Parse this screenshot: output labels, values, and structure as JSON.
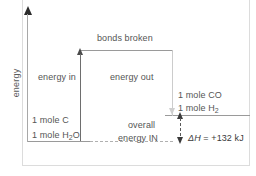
{
  "chart_data": {
    "type": "diagram",
    "ylabel": "energy",
    "xlabel": "",
    "grid": false,
    "legend": "none",
    "levels": [
      {
        "name": "reactants",
        "label_lines": [
          "1 mole C",
          "1 mole H2O"
        ],
        "relative_energy": 0
      },
      {
        "name": "bonds-broken-peak",
        "label": "bonds broken",
        "relative_energy": 1
      },
      {
        "name": "products",
        "label_lines": [
          "1 mole CO",
          "1 mole H2"
        ],
        "relative_energy": 0.29
      }
    ],
    "arrows": [
      {
        "name": "energy-in",
        "label": "energy in",
        "direction": "up"
      },
      {
        "name": "energy-out",
        "label": "energy out",
        "direction": "down"
      },
      {
        "name": "overall-energy-in",
        "label": "overall energy IN",
        "direction": "up",
        "value": "+132 kJ"
      }
    ],
    "enthalpy_change": {
      "symbol": "ΔH",
      "operator": "=",
      "value": "+132",
      "unit": "kJ"
    }
  },
  "diagram": {
    "y_axis_label": "energy",
    "top_level_label": "bonds broken",
    "energy_in_label": "energy in",
    "energy_out_label": "energy out",
    "reactant_line_1": "1 mole C",
    "reactant_line_2_pre": "1 mole H",
    "reactant_line_2_sub": "2",
    "reactant_line_2_post": "O",
    "product_line_1": "1 mole CO",
    "product_line_2_pre": "1 mole H",
    "product_line_2_sub": "2",
    "product_line_2_post": "",
    "overall_label_1": "overall",
    "overall_label_2": "energy IN",
    "delta_h_symbol": "ΔH",
    "delta_h_value": " = +132 kJ",
    "corner_mark": ""
  },
  "colors": {
    "axis": "#a8a8a8",
    "level_line": "#9a9a9a",
    "text": "#555555",
    "arrow_dark": "#3a3a3a",
    "arrow_light": "#cfcfcf",
    "background": "#ffffff"
  }
}
